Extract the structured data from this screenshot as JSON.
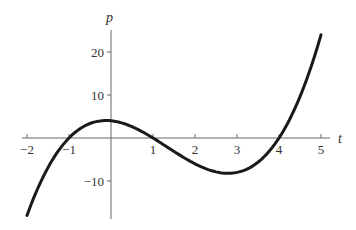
{
  "chart_data": {
    "type": "line",
    "title": "",
    "xlabel": "t",
    "ylabel": "p",
    "xlim": [
      -2,
      5
    ],
    "ylim": [
      -18,
      25
    ],
    "x_ticks": [
      -2,
      -1,
      1,
      2,
      3,
      4,
      5
    ],
    "x_tick_labels": [
      "−2",
      "−1",
      "1",
      "2",
      "3",
      "4",
      "5"
    ],
    "y_ticks": [
      20,
      10,
      -10
    ],
    "y_tick_labels": [
      "20",
      "10",
      "−10"
    ],
    "grid": false,
    "legend": null,
    "series": [
      {
        "name": "p(t) = (t+1)(t−1)(t−4)",
        "x": [
          -2,
          -1.5,
          -1,
          -0.5,
          0,
          0.5,
          1,
          1.5,
          2,
          2.5,
          3,
          3.5,
          4,
          4.5,
          5
        ],
        "values": [
          -18,
          -6.875,
          0,
          3.375,
          4,
          2.625,
          0,
          -3.125,
          -6,
          -7.875,
          -8,
          -5.625,
          0,
          9.625,
          24
        ]
      }
    ],
    "roots": [
      -1,
      1,
      4
    ],
    "colors": {
      "curve": "#1a1a1a",
      "axis": "#555555"
    }
  }
}
